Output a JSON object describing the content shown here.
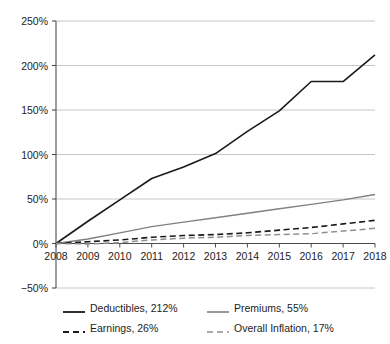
{
  "chart_data": {
    "type": "line",
    "title": "",
    "subtitle": "",
    "xlabel": "",
    "ylabel": "",
    "categories": [
      "2008",
      "2009",
      "2010",
      "2011",
      "2012",
      "2013",
      "2014",
      "2015",
      "2016",
      "2017",
      "2018"
    ],
    "x": [
      2008,
      2009,
      2010,
      2011,
      2012,
      2013,
      2014,
      2015,
      2016,
      2017,
      2018
    ],
    "ylim": [
      -50,
      250
    ],
    "yticks": [
      -50,
      0,
      50,
      100,
      150,
      200,
      250
    ],
    "ytick_labels": [
      "−50%",
      "0%",
      "50%",
      "100%",
      "150%",
      "200%",
      "250%"
    ],
    "xtick_labels": [
      "2008",
      "2009",
      "2010",
      "2011",
      "2012",
      "2013",
      "2014",
      "2015",
      "2016",
      "2017",
      "2018"
    ],
    "grid": true,
    "grid_axis": "y",
    "legend_position": "bottom",
    "units": "percent",
    "series": [
      {
        "name": "Deductibles",
        "label": "Deductibles, 212%",
        "final_value": 212,
        "style": "solid",
        "color": "#1a1a1a",
        "width": 1.6,
        "values": [
          0,
          25,
          49,
          73,
          86,
          101,
          126,
          149,
          182,
          182,
          212
        ]
      },
      {
        "name": "Premiums",
        "label": "Premiums, 55%",
        "final_value": 55,
        "style": "solid",
        "color": "#808080",
        "width": 1.4,
        "values": [
          0,
          5,
          12,
          19,
          24,
          29,
          34,
          39,
          44,
          49,
          55
        ]
      },
      {
        "name": "Earnings",
        "label": "Earnings, 26%",
        "final_value": 26,
        "style": "dashed",
        "color": "#1a1a1a",
        "width": 1.6,
        "values": [
          0,
          2,
          4,
          7,
          9,
          10,
          12,
          15,
          18,
          22,
          26
        ]
      },
      {
        "name": "Overall Inflation",
        "label": "Overall Inflation, 17%",
        "final_value": 17,
        "style": "dashed",
        "color": "#909090",
        "width": 1.5,
        "values": [
          0,
          -0.5,
          1,
          4,
          6,
          7,
          9,
          10,
          11,
          14,
          17
        ]
      }
    ]
  },
  "legend": {
    "items": [
      {
        "label": "Deductibles, 212%"
      },
      {
        "label": "Premiums, 55%"
      },
      {
        "label": "Earnings, 26%"
      },
      {
        "label": "Overall Inflation, 17%"
      }
    ]
  },
  "axes": {
    "y_labels": [
      "250%",
      "200%",
      "150%",
      "100%",
      "50%",
      "0%",
      "−50%"
    ],
    "x_labels": [
      "2008",
      "2009",
      "2010",
      "2011",
      "2012",
      "2013",
      "2014",
      "2015",
      "2016",
      "2017",
      "2018"
    ]
  },
  "colors": {
    "deductibles": "#1a1a1a",
    "premiums": "#808080",
    "earnings": "#1a1a1a",
    "inflation": "#909090",
    "grid": "#b8b8b8",
    "axis": "#4d4d4d",
    "text": "#1d1d1d",
    "background": "#ffffff"
  }
}
